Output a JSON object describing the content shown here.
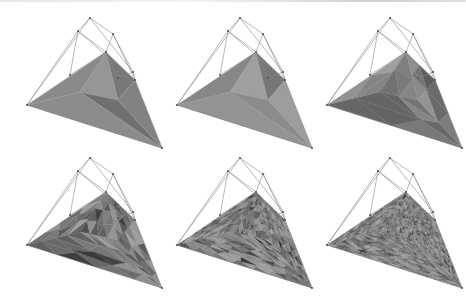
{
  "figure": {
    "colors": {
      "control_net": "#8a8a8a",
      "control_point": "#555555",
      "background": "#ffffff"
    },
    "panels": [
      {
        "id": 1,
        "row": 0,
        "col": 0,
        "x": 0,
        "y": 0,
        "refinement": 0
      },
      {
        "id": 2,
        "row": 0,
        "col": 1,
        "x": 150,
        "y": 0,
        "refinement": 1
      },
      {
        "id": 3,
        "row": 0,
        "col": 2,
        "x": 300,
        "y": 0,
        "refinement": 2
      },
      {
        "id": 4,
        "row": 1,
        "col": 0,
        "x": 0,
        "y": 140,
        "refinement": 3
      },
      {
        "id": 5,
        "row": 1,
        "col": 1,
        "x": 150,
        "y": 140,
        "refinement": 4
      },
      {
        "id": 6,
        "row": 1,
        "col": 2,
        "x": 300,
        "y": 140,
        "refinement": 5
      }
    ],
    "control_net": {
      "points": [
        [
          27,
          105
        ],
        [
          90,
          18
        ],
        [
          78,
          31
        ],
        [
          113,
          34
        ],
        [
          106,
          52
        ],
        [
          133,
          72
        ],
        [
          135,
          80
        ],
        [
          162,
          148
        ],
        [
          70,
          75
        ],
        [
          118,
          78
        ]
      ],
      "edges": [
        [
          0,
          1
        ],
        [
          0,
          2
        ],
        [
          2,
          1
        ],
        [
          1,
          3
        ],
        [
          2,
          4
        ],
        [
          1,
          5
        ],
        [
          3,
          4
        ],
        [
          3,
          6
        ],
        [
          5,
          6
        ],
        [
          6,
          7
        ],
        [
          2,
          8
        ],
        [
          8,
          4
        ],
        [
          4,
          9
        ],
        [
          9,
          5
        ],
        [
          2,
          6
        ],
        [
          3,
          5
        ]
      ]
    }
  }
}
